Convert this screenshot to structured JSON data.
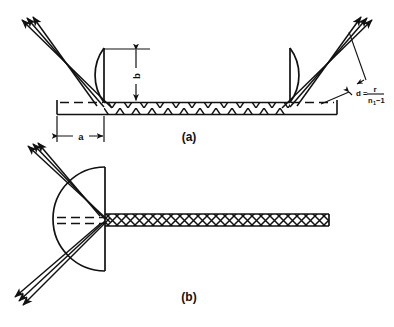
{
  "figure": {
    "background_color": "#ffffff",
    "ink_color": "#111111",
    "panels": [
      {
        "id": "a",
        "label": "(a)",
        "description": "Slab waveguide with two semicircular lenses at the ends and a sawtooth (zigzag) core; collimated ray bundles enter at the upper left and exit at the upper right.",
        "dimensions": [
          {
            "name": "a",
            "label": "a",
            "orientation": "horizontal"
          },
          {
            "name": "b",
            "label": "b",
            "orientation": "vertical"
          }
        ],
        "annotation": {
          "name": "focal-distance-formula",
          "lead": "d",
          "equals": "=",
          "numerator": "r",
          "denominator_n": "n",
          "denominator_sub": "1",
          "denominator_rest": "−1",
          "plain": "d = r / (n₁ − 1)"
        },
        "ray_count": 3,
        "core_pattern": "sawtooth"
      },
      {
        "id": "b",
        "label": "(b)",
        "description": "Single semicircular lens coupled to a crosshatched waveguide; ray bundle enters from the upper left, focuses at the waveguide entrance, and diverges to the lower left.",
        "ray_count": 3,
        "core_pattern": "crosshatch"
      }
    ]
  }
}
